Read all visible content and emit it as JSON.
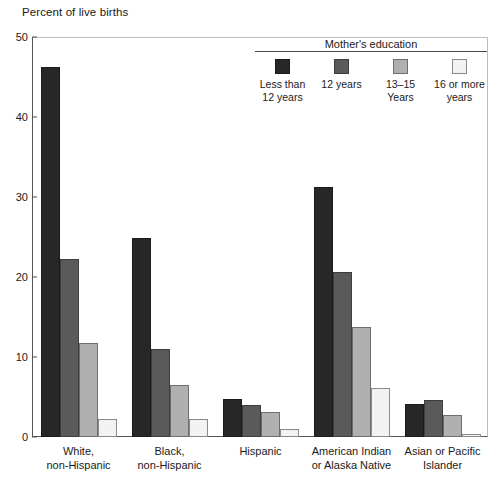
{
  "chart_data": {
    "type": "bar",
    "title": "",
    "ylabel": "Percent of live births",
    "xlabel": "",
    "ylim": [
      0,
      50
    ],
    "yticks": [
      0,
      10,
      20,
      30,
      40,
      50
    ],
    "grid": false,
    "legend_position": "top-right",
    "legend_title": "Mother's education",
    "categories": [
      "White,\nnon-Hispanic",
      "Black,\nnon-Hispanic",
      "Hispanic",
      "American Indian\nor Alaska Native",
      "Asian or Pacific\nIslander"
    ],
    "series": [
      {
        "name": "Less than\n12 years",
        "color": "#272727",
        "values": [
          46.2,
          24.9,
          4.7,
          31.3,
          4.1
        ]
      },
      {
        "name": "12 years",
        "color": "#5a5a5a",
        "values": [
          22.3,
          11.0,
          4.0,
          20.6,
          4.6
        ]
      },
      {
        "name": "13–15 Years",
        "color": "#b0b0b0",
        "values": [
          11.7,
          6.5,
          3.1,
          13.7,
          2.8
        ]
      },
      {
        "name": "16 or more\nyears",
        "color": "#f2f2f2",
        "values": [
          2.3,
          2.2,
          1.0,
          6.1,
          0.4
        ]
      }
    ]
  },
  "axes": {
    "y_title": "Percent of live births",
    "y_tick_labels": [
      "0",
      "10",
      "20",
      "30",
      "40",
      "50"
    ]
  },
  "legend": {
    "title": "Mother's education",
    "items": [
      {
        "label": "Less than\n12 years",
        "swatch": "swatch-less-than-12-years"
      },
      {
        "label": "12 years",
        "swatch": "swatch-12-years"
      },
      {
        "label": "13–15 Years",
        "swatch": "swatch-13-15-years"
      },
      {
        "label": "16 or more\nyears",
        "swatch": "swatch-16-or-more-years"
      }
    ]
  },
  "x_axis_labels": [
    "White,\nnon-Hispanic",
    "Black,\nnon-Hispanic",
    "Hispanic",
    "American Indian\nor Alaska Native",
    "Asian or Pacific\nIslander"
  ]
}
